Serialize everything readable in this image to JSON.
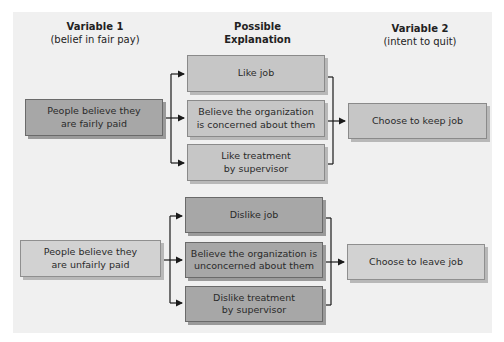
{
  "headers": {
    "var1": {
      "title": "Variable 1",
      "subtitle": "(belief in fair pay)"
    },
    "explanation": {
      "title_line1": "Possible",
      "title_line2": "Explanation"
    },
    "var2": {
      "title": "Variable 2",
      "subtitle": "(intent to quit)"
    }
  },
  "top": {
    "source": {
      "line1": "People believe they",
      "line2": "are fairly paid"
    },
    "explanations": [
      {
        "line1": "Like job",
        "line2": ""
      },
      {
        "line1": "Believe the organization",
        "line2": "is concerned about them"
      },
      {
        "line1": "Like treatment",
        "line2": "by supervisor"
      }
    ],
    "outcome": {
      "line1": "Choose to keep job"
    }
  },
  "bottom": {
    "source": {
      "line1": "People believe they",
      "line2": "are unfairly paid"
    },
    "explanations": [
      {
        "line1": "Dislike job",
        "line2": ""
      },
      {
        "line1": "Believe the organization is",
        "line2": "unconcerned about them"
      },
      {
        "line1": "Dislike treatment",
        "line2": "by supervisor"
      }
    ],
    "outcome": {
      "line1": "Choose to leave job"
    }
  },
  "colors": {
    "panel": "#f0f0f0",
    "dark_box": "#a7a7a7",
    "light_box": "#d2d2d2",
    "mid_box": "#c6c6c6",
    "line": "#1a1a1a"
  }
}
